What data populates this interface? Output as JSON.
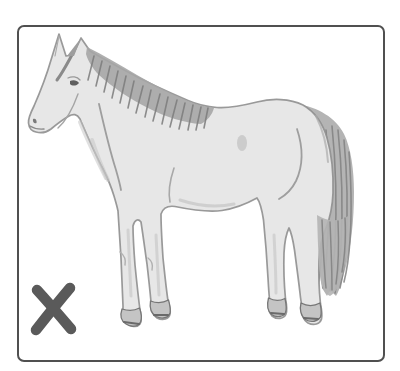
{
  "window": {
    "width_px": 400,
    "height_px": 371,
    "background": "#ffffff"
  },
  "card": {
    "background": "#ffffff",
    "border_color": "#505050",
    "border_width_px": 2,
    "corner_radius_px": 7
  },
  "illustration": {
    "subject": "horse",
    "description": "Grayscale pencil sketch of a horse standing in profile facing left, with dark hatched mane along the neck and a long gray tail",
    "colors": {
      "body_fill": "#e7e7e7",
      "outline": "#8f8f8f",
      "mane": "#a6a6a6",
      "mane_hatch": "#7c7c7c",
      "tail": "#b4b4b4",
      "tail_strand": "#828282",
      "shading": "#c3c3c3",
      "crease": "#9e9e9e",
      "hoof_fill": "#c4c4c4",
      "hoof_outline": "#767676",
      "eye": "#5f5f5f"
    }
  },
  "marker": {
    "glyph": "X",
    "meaning": "crossed-out / incorrect indicator",
    "color": "#5a5a5a",
    "position": "bottom-left",
    "stroke_width_px": 10.5
  }
}
